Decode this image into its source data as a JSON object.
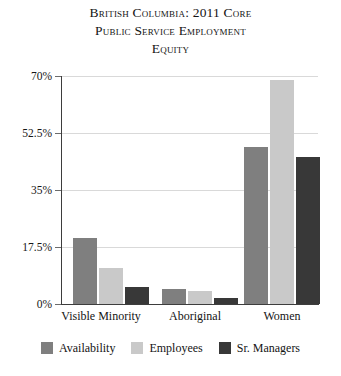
{
  "chart_data": {
    "type": "bar",
    "title": "British Columbia: 2011 Core Public Service Employment Equity",
    "title_lines": [
      "British Columbia: 2011 Core",
      "Public Service Employment",
      "Equity"
    ],
    "xlabel": "",
    "ylabel": "",
    "categories": [
      "Visible Minority",
      "Aboriginal",
      "Women"
    ],
    "series": [
      {
        "name": "Availability",
        "color": "#7f7f7f",
        "values": [
          20.3,
          4.6,
          48.2
        ]
      },
      {
        "name": "Employees",
        "color": "#c9c9c9",
        "values": [
          11.0,
          4.0,
          68.8
        ]
      },
      {
        "name": "Sr. Managers",
        "color": "#383838",
        "values": [
          5.2,
          1.7,
          45.1
        ]
      }
    ],
    "ylim": [
      0,
      70
    ],
    "ytick_labels": [
      "0%",
      "17.5%",
      "35%",
      "52.5%",
      "70%"
    ],
    "ytick_values": [
      0,
      17.5,
      35,
      52.5,
      70
    ],
    "grid": true,
    "legend_position": "bottom"
  },
  "legend": {
    "entries": [
      {
        "label": "Availability",
        "color": "#7f7f7f"
      },
      {
        "label": "Employees",
        "color": "#c9c9c9"
      },
      {
        "label": "Sr. Managers",
        "color": "#383838"
      }
    ]
  }
}
